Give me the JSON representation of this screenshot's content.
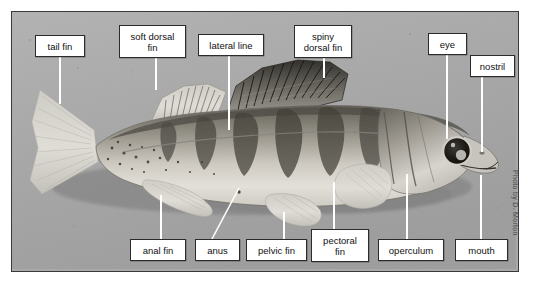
{
  "figure": {
    "credit": "Photo by D. Morton",
    "frame_color": "#3a3a3a",
    "background_color": "#a9a9a9",
    "label_box_fill": "#ffffff",
    "label_box_border": "#2b2b2b",
    "leader_line_color": "#ffffff"
  },
  "labels": [
    {
      "id": "tail-fin",
      "text": "tail fin",
      "box": {
        "x": 35,
        "y": 35,
        "w": 50,
        "h": 22
      },
      "leader": {
        "type": "v",
        "x": 59,
        "y1": 57,
        "y2": 104
      }
    },
    {
      "id": "soft-dorsal-fin",
      "text": "soft dorsal\nfin",
      "box": {
        "x": 119,
        "y": 25,
        "w": 67,
        "h": 33
      },
      "leader": {
        "type": "v",
        "x": 155,
        "y1": 58,
        "y2": 90
      }
    },
    {
      "id": "lateral-line",
      "text": "lateral line",
      "box": {
        "x": 198,
        "y": 34,
        "w": 66,
        "h": 22
      },
      "leader": {
        "type": "v",
        "x": 228,
        "y1": 56,
        "y2": 130
      }
    },
    {
      "id": "spiny-dorsal-fin",
      "text": "spiny\ndorsal fin",
      "box": {
        "x": 294,
        "y": 25,
        "w": 58,
        "h": 33
      },
      "leader": {
        "type": "v",
        "x": 323,
        "y1": 58,
        "y2": 78
      }
    },
    {
      "id": "eye",
      "text": "eye",
      "box": {
        "x": 428,
        "y": 33,
        "w": 39,
        "h": 22
      },
      "leader": {
        "type": "v",
        "x": 446,
        "y1": 55,
        "y2": 139
      }
    },
    {
      "id": "nostril",
      "text": "nostril",
      "box": {
        "x": 470,
        "y": 55,
        "w": 45,
        "h": 22
      },
      "leader": {
        "type": "v",
        "x": 481,
        "y1": 77,
        "y2": 152
      }
    },
    {
      "id": "anal-fin",
      "text": "anal fin",
      "box": {
        "x": 130,
        "y": 239,
        "w": 56,
        "h": 22
      },
      "leader": {
        "type": "v",
        "x": 160,
        "y1": 195,
        "y2": 239
      }
    },
    {
      "id": "anus",
      "text": "anus",
      "box": {
        "x": 195,
        "y": 239,
        "w": 45,
        "h": 22
      },
      "leader": {
        "type": "d",
        "x1": 239,
        "y1": 188,
        "x2": 212,
        "y2": 239
      }
    },
    {
      "id": "pelvic-fin",
      "text": "pelvic fin",
      "box": {
        "x": 246,
        "y": 239,
        "w": 61,
        "h": 22
      },
      "leader": {
        "type": "v",
        "x": 283,
        "y1": 212,
        "y2": 239
      }
    },
    {
      "id": "pectoral-fin",
      "text": "pectoral\nfin",
      "box": {
        "x": 311,
        "y": 229,
        "w": 58,
        "h": 33
      },
      "leader": {
        "type": "v",
        "x": 333,
        "y1": 182,
        "y2": 229
      }
    },
    {
      "id": "operculum",
      "text": "operculum",
      "box": {
        "x": 378,
        "y": 239,
        "w": 66,
        "h": 22
      },
      "leader": {
        "type": "v",
        "x": 406,
        "y1": 174,
        "y2": 239
      }
    },
    {
      "id": "mouth",
      "text": "mouth",
      "box": {
        "x": 455,
        "y": 239,
        "w": 53,
        "h": 22
      },
      "leader": {
        "type": "v",
        "x": 480,
        "y1": 175,
        "y2": 239
      }
    }
  ]
}
